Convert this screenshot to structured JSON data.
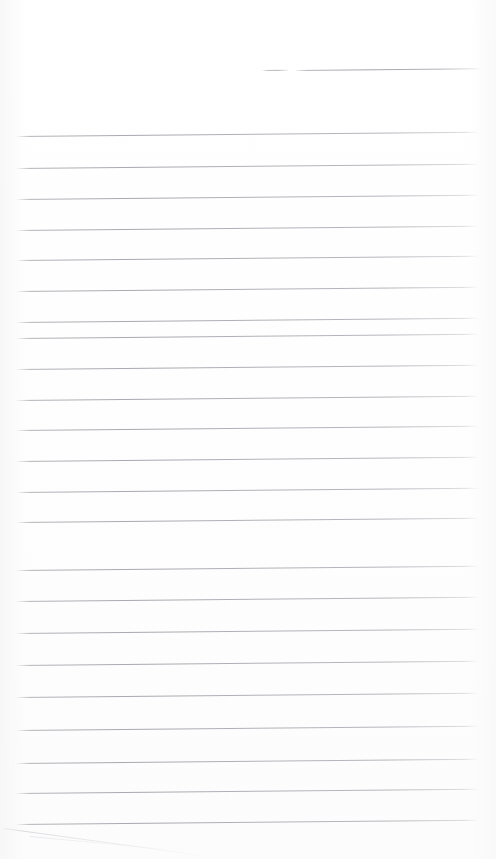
{
  "document": {
    "kind": "scanned-lined-page",
    "title": "Blank Ruled Page",
    "page_width": 496,
    "page_height": 859,
    "background_color": "#ffffff",
    "paper_tone": "#fdfdfd",
    "rule_color": "#aaaab1",
    "written_text": "",
    "handwriting_present": "none",
    "notes": ""
  },
  "ruling": {
    "style": "horizontal-rules",
    "rule_count": 24,
    "rule_spacing_px": 30.5,
    "left_margin_px": 16,
    "right_margin_px": 478,
    "skew_degrees": -0.52,
    "first_rule_y": 70,
    "last_rule_y": 824,
    "rules": [
      {
        "y": 70,
        "x1": 262,
        "x2": 288,
        "partial": true
      },
      {
        "y": 70,
        "x1": 296,
        "x2": 480,
        "partial": true
      },
      {
        "y": 136,
        "x1": 17,
        "x2": 478,
        "partial": false
      },
      {
        "y": 168,
        "x1": 17,
        "x2": 478,
        "partial": false
      },
      {
        "y": 199,
        "x1": 17,
        "x2": 478,
        "partial": false
      },
      {
        "y": 230,
        "x1": 17,
        "x2": 478,
        "partial": false
      },
      {
        "y": 260,
        "x1": 17,
        "x2": 478,
        "partial": false
      },
      {
        "y": 291,
        "x1": 17,
        "x2": 478,
        "partial": false
      },
      {
        "y": 322,
        "x1": 17,
        "x2": 478,
        "partial": false
      },
      {
        "y": 338,
        "x1": 17,
        "x2": 478,
        "partial": false
      },
      {
        "y": 369,
        "x1": 17,
        "x2": 478,
        "partial": false
      },
      {
        "y": 400,
        "x1": 17,
        "x2": 478,
        "partial": false
      },
      {
        "y": 430,
        "x1": 17,
        "x2": 478,
        "partial": false
      },
      {
        "y": 461,
        "x1": 17,
        "x2": 478,
        "partial": false
      },
      {
        "y": 492,
        "x1": 17,
        "x2": 478,
        "partial": false
      },
      {
        "y": 522,
        "x1": 17,
        "x2": 478,
        "partial": false
      },
      {
        "y": 570,
        "x1": 17,
        "x2": 478,
        "partial": false
      },
      {
        "y": 601,
        "x1": 17,
        "x2": 478,
        "partial": false
      },
      {
        "y": 633,
        "x1": 17,
        "x2": 478,
        "partial": false
      },
      {
        "y": 665,
        "x1": 17,
        "x2": 478,
        "partial": false
      },
      {
        "y": 697,
        "x1": 17,
        "x2": 478,
        "partial": false
      },
      {
        "y": 730,
        "x1": 17,
        "x2": 478,
        "partial": false
      },
      {
        "y": 763,
        "x1": 17,
        "x2": 478,
        "partial": false
      },
      {
        "y": 793,
        "x1": 17,
        "x2": 478,
        "partial": false
      },
      {
        "y": 824,
        "x1": 17,
        "x2": 478,
        "partial": false
      }
    ]
  },
  "artifacts": [
    {
      "name": "diagonal-scan-streak",
      "x1": 4,
      "y1": 828,
      "x2": 216,
      "y2": 857,
      "color": "#cfcfd5"
    },
    {
      "name": "diagonal-scan-streak-secondary",
      "x1": 30,
      "y1": 836,
      "x2": 200,
      "y2": 852,
      "color": "#dedee3"
    }
  ]
}
